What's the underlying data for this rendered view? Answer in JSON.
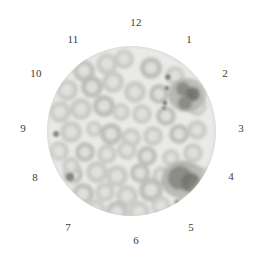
{
  "image": {
    "kind": "microscopy-field-of-view",
    "subject": "peripheral blood smear",
    "width": 258,
    "height": 257,
    "background_color": "#ffffff"
  },
  "field_of_view": {
    "shape": "circle",
    "center_x": 131,
    "center_y": 131,
    "radius": 84,
    "background_color": "#ebebe9",
    "label_color": "#3c3c3c"
  },
  "clock_labels": [
    {
      "id": "clock-1",
      "text": "1",
      "x": 189,
      "y": 40
    },
    {
      "id": "clock-2",
      "text": "2",
      "x": 225,
      "y": 74
    },
    {
      "id": "clock-3",
      "text": "3",
      "x": 241,
      "y": 129
    },
    {
      "id": "clock-4",
      "text": "4",
      "x": 231,
      "y": 177
    },
    {
      "id": "clock-5",
      "text": "5",
      "x": 191,
      "y": 228
    },
    {
      "id": "clock-6",
      "text": "6",
      "x": 136,
      "y": 241
    },
    {
      "id": "clock-7",
      "text": "7",
      "x": 68,
      "y": 228
    },
    {
      "id": "clock-8",
      "text": "8",
      "x": 35,
      "y": 178
    },
    {
      "id": "clock-9",
      "text": "9",
      "x": 23,
      "y": 129
    },
    {
      "id": "clock-10",
      "text": "10",
      "x": 36,
      "y": 74
    },
    {
      "id": "clock-11",
      "text": "11",
      "x": 73,
      "y": 40
    },
    {
      "id": "clock-12",
      "text": "12",
      "x": 136,
      "y": 23
    }
  ],
  "cell_palette": {
    "plasma": "#ebebe9",
    "erythrocyte_rim": "#c9c9c6",
    "erythrocyte_rim_dark": "#bcbcb8",
    "erythrocyte_pallor": "#e2e2df",
    "leukocyte_cytoplasm": "#b3b3ae",
    "leukocyte_nucleus": "#8a8a85",
    "leukocyte_nucleus_dark": "#707069",
    "platelet": "#6e6e68"
  },
  "cells": {
    "erythrocytes": [
      {
        "cx": 37,
        "cy": 25,
        "r": 11
      },
      {
        "cx": 60,
        "cy": 18,
        "r": 11
      },
      {
        "cx": 77,
        "cy": 13,
        "r": 10
      },
      {
        "cx": 104,
        "cy": 22,
        "r": 11
      },
      {
        "cx": 128,
        "cy": 30,
        "r": 10
      },
      {
        "cx": 20,
        "cy": 44,
        "r": 11
      },
      {
        "cx": 45,
        "cy": 41,
        "r": 11
      },
      {
        "cx": 66,
        "cy": 36,
        "r": 11
      },
      {
        "cx": 88,
        "cy": 46,
        "r": 11
      },
      {
        "cx": 112,
        "cy": 48,
        "r": 10
      },
      {
        "cx": 13,
        "cy": 66,
        "r": 11
      },
      {
        "cx": 34,
        "cy": 63,
        "r": 11
      },
      {
        "cx": 57,
        "cy": 60,
        "r": 11
      },
      {
        "cx": 74,
        "cy": 66,
        "r": 9
      },
      {
        "cx": 95,
        "cy": 68,
        "r": 10
      },
      {
        "cx": 119,
        "cy": 70,
        "r": 10
      },
      {
        "cx": 24,
        "cy": 86,
        "r": 11
      },
      {
        "cx": 47,
        "cy": 83,
        "r": 8
      },
      {
        "cx": 64,
        "cy": 88,
        "r": 11
      },
      {
        "cx": 84,
        "cy": 92,
        "r": 10
      },
      {
        "cx": 106,
        "cy": 90,
        "r": 10
      },
      {
        "cx": 132,
        "cy": 88,
        "r": 10
      },
      {
        "cx": 150,
        "cy": 84,
        "r": 10
      },
      {
        "cx": 12,
        "cy": 105,
        "r": 10
      },
      {
        "cx": 38,
        "cy": 106,
        "r": 10
      },
      {
        "cx": 60,
        "cy": 108,
        "r": 10
      },
      {
        "cx": 80,
        "cy": 104,
        "r": 10
      },
      {
        "cx": 100,
        "cy": 110,
        "r": 10
      },
      {
        "cx": 124,
        "cy": 112,
        "r": 9
      },
      {
        "cx": 146,
        "cy": 107,
        "r": 10
      },
      {
        "cx": 26,
        "cy": 128,
        "r": 10
      },
      {
        "cx": 50,
        "cy": 126,
        "r": 11
      },
      {
        "cx": 70,
        "cy": 130,
        "r": 11
      },
      {
        "cx": 93,
        "cy": 127,
        "r": 10
      },
      {
        "cx": 115,
        "cy": 130,
        "r": 10
      },
      {
        "cx": 136,
        "cy": 125,
        "r": 10
      },
      {
        "cx": 36,
        "cy": 148,
        "r": 11
      },
      {
        "cx": 58,
        "cy": 146,
        "r": 10
      },
      {
        "cx": 80,
        "cy": 150,
        "r": 11
      },
      {
        "cx": 104,
        "cy": 144,
        "r": 12
      },
      {
        "cx": 24,
        "cy": 120,
        "r": 9
      },
      {
        "cx": 48,
        "cy": 164,
        "r": 11
      },
      {
        "cx": 70,
        "cy": 166,
        "r": 11
      },
      {
        "cx": 92,
        "cy": 166,
        "r": 11
      },
      {
        "cx": 114,
        "cy": 160,
        "r": 10
      },
      {
        "cx": 60,
        "cy": 182,
        "r": 10
      },
      {
        "cx": 82,
        "cy": 184,
        "r": 10
      },
      {
        "cx": 103,
        "cy": 180,
        "r": 10
      },
      {
        "cx": 124,
        "cy": 176,
        "r": 9
      },
      {
        "cx": 150,
        "cy": 60,
        "r": 10
      },
      {
        "cx": 156,
        "cy": 130,
        "r": 9
      },
      {
        "cx": 140,
        "cy": 152,
        "r": 9
      }
    ],
    "leukocytes": [
      {
        "name": "neutrophil-upper-right",
        "cx": 140,
        "cy": 49,
        "rx": 19,
        "ry": 17,
        "lobes": [
          {
            "cx": 136,
            "cy": 43,
            "r": 7
          },
          {
            "cx": 146,
            "cy": 48,
            "r": 7
          },
          {
            "cx": 138,
            "cy": 57,
            "r": 7
          }
        ]
      },
      {
        "name": "lymphocyte-lower-right",
        "cx": 137,
        "cy": 134,
        "rx": 23,
        "ry": 19,
        "lobes": [
          {
            "cx": 133,
            "cy": 132,
            "r": 12
          },
          {
            "cx": 144,
            "cy": 137,
            "r": 10
          }
        ]
      }
    ],
    "platelets": [
      {
        "cx": 121,
        "cy": 31,
        "r": 2.6
      },
      {
        "cx": 120,
        "cy": 42,
        "r": 2.2
      },
      {
        "cx": 118,
        "cy": 57,
        "r": 2.4
      },
      {
        "cx": 117,
        "cy": 62,
        "r": 1.8
      },
      {
        "cx": 9,
        "cy": 88,
        "r": 3.0
      },
      {
        "cx": 23,
        "cy": 131,
        "r": 4.0
      },
      {
        "cx": 130,
        "cy": 156,
        "r": 2.6
      }
    ]
  }
}
